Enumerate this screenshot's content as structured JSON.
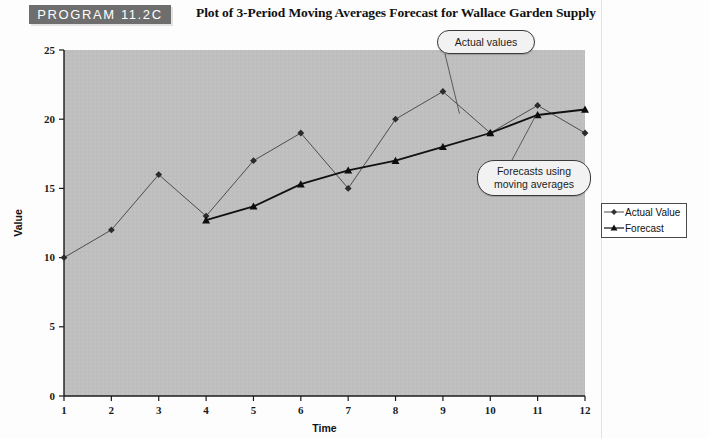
{
  "header": {
    "program_badge": "PROGRAM 11.2C",
    "title": "Plot of 3-Period Moving Averages Forecast for Wallace Garden Supply"
  },
  "callouts": {
    "actual": "Actual values",
    "forecast": "Forecasts using moving averages"
  },
  "legend": {
    "items": [
      {
        "label": "Actual Value",
        "marker": "diamond",
        "color": "#4d4d4d"
      },
      {
        "label": "Forecast",
        "marker": "triangle",
        "color": "#111111"
      }
    ]
  },
  "chart_data": {
    "type": "line",
    "title": "Plot of 3-Period Moving Averages Forecast for Wallace Garden Supply",
    "xlabel": "Time",
    "ylabel": "Value",
    "xlim": [
      1,
      12
    ],
    "ylim": [
      0,
      25
    ],
    "ytick_labels": [
      "0",
      "5",
      "10",
      "15",
      "20",
      "25"
    ],
    "yticks": [
      0,
      5,
      10,
      15,
      20,
      25
    ],
    "xtick_labels": [
      "1",
      "2",
      "3",
      "4",
      "5",
      "6",
      "7",
      "8",
      "9",
      "10",
      "11",
      "12"
    ],
    "xticks": [
      1,
      2,
      3,
      4,
      5,
      6,
      7,
      8,
      9,
      10,
      11,
      12
    ],
    "grid": false,
    "plot_background": "#bfbfbf",
    "legend_position": "right",
    "x": [
      1,
      2,
      3,
      4,
      5,
      6,
      7,
      8,
      9,
      10,
      11,
      12
    ],
    "series": [
      {
        "name": "Actual Value",
        "marker": "diamond",
        "color": "#4d4d4d",
        "values": [
          10,
          12,
          16,
          13,
          17,
          19,
          15,
          20,
          22,
          19,
          21,
          19
        ]
      },
      {
        "name": "Forecast",
        "marker": "triangle",
        "color": "#111111",
        "x": [
          4,
          5,
          6,
          7,
          8,
          9,
          10,
          11,
          12
        ],
        "values": [
          12.7,
          13.7,
          15.3,
          16.3,
          17.0,
          18.0,
          19.0,
          20.3,
          20.7
        ]
      }
    ],
    "annotations": [
      {
        "text": "Actual values",
        "points_to_x": 9.3,
        "points_to_y": 20.5
      },
      {
        "text": "Forecasts using moving averages",
        "points_to_x": 10.8,
        "points_to_y": 20.4
      }
    ]
  }
}
